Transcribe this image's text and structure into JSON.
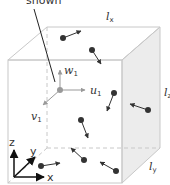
{
  "diagram": {
    "title_fragment": "shown",
    "box": {
      "length_x_label": "l",
      "length_x_sub": "x",
      "length_y_label": "l",
      "length_y_sub": "y",
      "length_z_label": "l",
      "length_z_sub": "z"
    },
    "velocity_components": {
      "u_label": "u",
      "u_sub": "1",
      "v_label": "v",
      "v_sub": "1",
      "w_label": "w",
      "w_sub": "1"
    },
    "axes": {
      "x_label": "x",
      "y_label": "y",
      "z_label": "z"
    },
    "colors": {
      "box_line": "#c8c8c8",
      "side_face": "#ececec",
      "particle": "#333333",
      "component_arrows": "#999999",
      "text": "#333333"
    },
    "particle_count": 8
  }
}
